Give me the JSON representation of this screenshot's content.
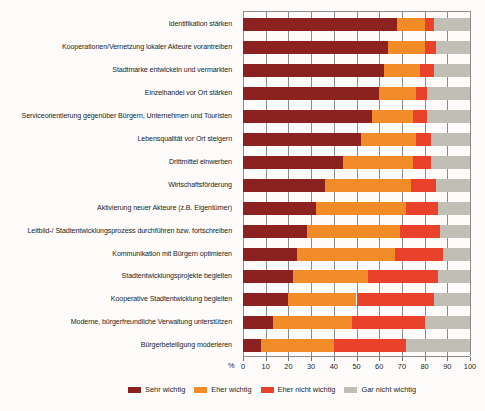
{
  "chart_data": {
    "type": "bar",
    "orientation": "horizontal",
    "stacked": true,
    "stacked_percent": true,
    "title": "",
    "subtitle": "",
    "xlabel": "%",
    "ylabel": "",
    "xlim": [
      0,
      100
    ],
    "xticks": [
      0,
      10,
      20,
      30,
      40,
      50,
      60,
      70,
      80,
      90,
      100
    ],
    "xticklabels": [
      "0",
      "10",
      "20",
      "30",
      "40",
      "50",
      "60",
      "70",
      "80",
      "90",
      "100"
    ],
    "grid": true,
    "grid_axis": "x",
    "legend_position": "bottom",
    "unit_symbol": "%",
    "categories": [
      "Identifikation stärken",
      "Kooperationen/Vernetzung lokaler Akteure vorantreiben",
      "Stadtmarke entwickeln und vermarkten",
      "Einzelhandel vor Ort stärken",
      "Serviceorientierung gegenüber Bürgern, Unternehmen und Touristen",
      "Lebensqualität vor Ort steigern",
      "Drittmittel einwerben",
      "Wirtschaftsförderung",
      "Aktivierung neuer Akteure (z.B. Eigentümer)",
      "Leitbild-/ Stadtentwicklungsprozess durchführen bzw. fortschreiben",
      "Kommunikation mit Bürgern optimieren",
      "Stadtentwicklungsprojekte begleiten",
      "Kooperative Stadtentwicklung begleiten",
      "Moderne, bürgerfreundliche Verwaltung unterstützen",
      "Bürgerbeteiligung moderieren"
    ],
    "series": [
      {
        "name": "Sehr wichtig",
        "color": "#8C2220",
        "values": [
          68,
          64,
          62,
          60,
          57,
          52,
          44,
          36,
          32,
          28,
          24,
          22,
          20,
          13,
          8
        ]
      },
      {
        "name": "Eher wichtig",
        "color": "#F28C28",
        "values": [
          12,
          16,
          16,
          16,
          18,
          24,
          31,
          38,
          40,
          41,
          43,
          33,
          30,
          35,
          32
        ]
      },
      {
        "name": "Eher nicht wichtig",
        "color": "#E8432A",
        "values": [
          4,
          5,
          6,
          5,
          6,
          7,
          8,
          11,
          14,
          18,
          21,
          31,
          34,
          32,
          32
        ]
      },
      {
        "name": "Gar nicht wichtig",
        "color": "#BFBFB6",
        "values": [
          16,
          15,
          16,
          19,
          19,
          17,
          17,
          15,
          14,
          13,
          12,
          14,
          16,
          20,
          28
        ]
      }
    ],
    "legend_entries": [
      {
        "label": "Sehr wichtig",
        "color": "#8C2220"
      },
      {
        "label": "Eher wichtig",
        "color": "#F28C28"
      },
      {
        "label": "Eher nicht wichtig",
        "color": "#E8432A"
      },
      {
        "label": "Gar nicht wichtig",
        "color": "#BFBFB6"
      }
    ]
  }
}
